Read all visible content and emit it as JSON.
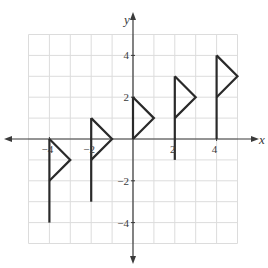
{
  "chart_data": {
    "type": "line",
    "title": "",
    "xlabel": "x",
    "ylabel": "y",
    "xlim": [
      -5,
      5
    ],
    "ylim": [
      -5,
      5
    ],
    "grid": true,
    "x_tick_labels": [
      "-4",
      "-2",
      "2",
      "4"
    ],
    "y_tick_labels": [
      "4",
      "2",
      "-2",
      "-4"
    ],
    "flags": [
      {
        "pole_x": -4,
        "pole_bottom": -4,
        "pole_top": 0,
        "triangle": [
          [
            -4,
            0
          ],
          [
            -3,
            -1
          ],
          [
            -4,
            -2
          ]
        ]
      },
      {
        "pole_x": -2,
        "pole_bottom": -3,
        "pole_top": 1,
        "triangle": [
          [
            -2,
            1
          ],
          [
            -1,
            0
          ],
          [
            -2,
            -1
          ]
        ]
      },
      {
        "pole_x": 0,
        "pole_bottom": 0,
        "pole_top": 2,
        "triangle": [
          [
            0,
            2
          ],
          [
            1,
            1
          ],
          [
            0,
            0
          ]
        ]
      },
      {
        "pole_x": 2,
        "pole_bottom": -1,
        "pole_top": 3,
        "triangle": [
          [
            2,
            3
          ],
          [
            3,
            2
          ],
          [
            2,
            1
          ]
        ]
      },
      {
        "pole_x": 4,
        "pole_bottom": 0,
        "pole_top": 4,
        "triangle": [
          [
            4,
            4
          ],
          [
            5,
            3
          ],
          [
            4,
            2
          ]
        ]
      }
    ]
  },
  "axes": {
    "x_label": "x",
    "y_label": "y",
    "x_ticks": [
      {
        "v": -4,
        "t": "-4"
      },
      {
        "v": -2,
        "t": "-2"
      },
      {
        "v": 2,
        "t": "2"
      },
      {
        "v": 4,
        "t": "4"
      }
    ],
    "y_ticks": [
      {
        "v": 4,
        "t": "4"
      },
      {
        "v": 2,
        "t": "2"
      },
      {
        "v": -2,
        "t": "-2"
      },
      {
        "v": -4,
        "t": "-4"
      }
    ]
  },
  "colors": {
    "grid": "#dcdcdc",
    "axis": "#3a3a3a",
    "flag": "#2a2a2a"
  }
}
